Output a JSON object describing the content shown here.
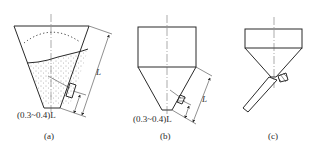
{
  "figure": {
    "panels": [
      {
        "id": "a",
        "caption": "(a)",
        "dimension_label": "(0.3~0.4)L",
        "length_label": "L",
        "description": "Tapered hopper with bulk material fill, level sensor mounted on inclined wall"
      },
      {
        "id": "b",
        "caption": "(b)",
        "dimension_label": "(0.3~0.4)L",
        "length_label": "L",
        "description": "Cylindrical bin with conical bottom, sensor mounted on cone wall"
      },
      {
        "id": "c",
        "caption": "(c)",
        "description": "Bin with conical bottom and inclined discharge chute, sensor at chute junction"
      }
    ]
  }
}
